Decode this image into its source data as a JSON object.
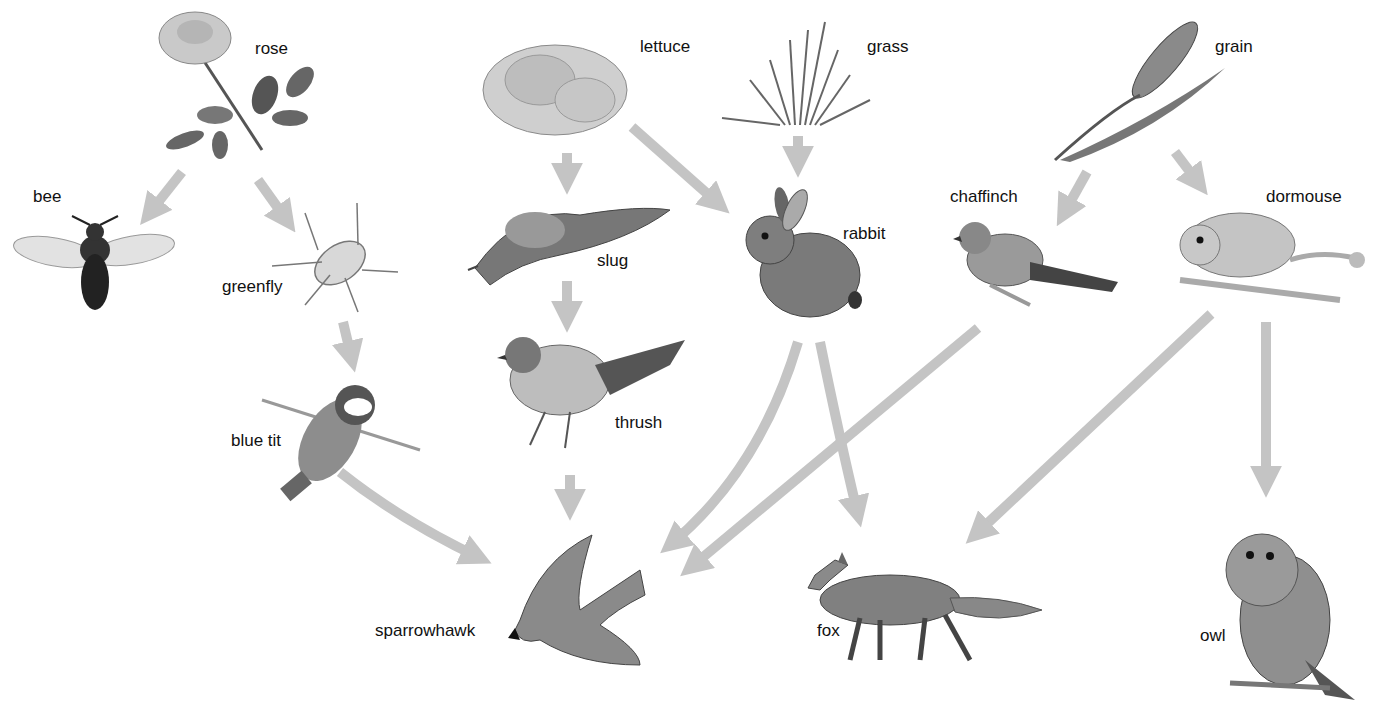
{
  "diagram": {
    "arrow_color": "#c4c4c4",
    "organisms": [
      {
        "id": "rose",
        "label": "rose",
        "x": 255,
        "y": 40
      },
      {
        "id": "lettuce",
        "label": "lettuce",
        "x": 640,
        "y": 38
      },
      {
        "id": "grass",
        "label": "grass",
        "x": 867,
        "y": 38
      },
      {
        "id": "grain",
        "label": "grain",
        "x": 1215,
        "y": 38
      },
      {
        "id": "bee",
        "label": "bee",
        "x": 33,
        "y": 188
      },
      {
        "id": "greenfly",
        "label": "greenfly",
        "x": 222,
        "y": 278
      },
      {
        "id": "slug",
        "label": "slug",
        "x": 597,
        "y": 252
      },
      {
        "id": "rabbit",
        "label": "rabbit",
        "x": 843,
        "y": 225
      },
      {
        "id": "chaffinch",
        "label": "chaffinch",
        "x": 950,
        "y": 188
      },
      {
        "id": "dormouse",
        "label": "dormouse",
        "x": 1266,
        "y": 188
      },
      {
        "id": "blue_tit",
        "label": "blue tit",
        "x": 231,
        "y": 432
      },
      {
        "id": "thrush",
        "label": "thrush",
        "x": 615,
        "y": 414
      },
      {
        "id": "sparrowhawk",
        "label": "sparrowhawk",
        "x": 375,
        "y": 622
      },
      {
        "id": "fox",
        "label": "fox",
        "x": 817,
        "y": 622
      },
      {
        "id": "owl",
        "label": "owl",
        "x": 1200,
        "y": 627
      }
    ],
    "links": [
      {
        "from": "rose",
        "to": "bee"
      },
      {
        "from": "rose",
        "to": "greenfly"
      },
      {
        "from": "greenfly",
        "to": "blue_tit"
      },
      {
        "from": "blue_tit",
        "to": "sparrowhawk"
      },
      {
        "from": "lettuce",
        "to": "slug"
      },
      {
        "from": "lettuce",
        "to": "rabbit"
      },
      {
        "from": "grass",
        "to": "rabbit"
      },
      {
        "from": "slug",
        "to": "thrush"
      },
      {
        "from": "thrush",
        "to": "sparrowhawk"
      },
      {
        "from": "rabbit",
        "to": "sparrowhawk"
      },
      {
        "from": "rabbit",
        "to": "fox"
      },
      {
        "from": "grain",
        "to": "chaffinch"
      },
      {
        "from": "grain",
        "to": "dormouse"
      },
      {
        "from": "chaffinch",
        "to": "sparrowhawk"
      },
      {
        "from": "dormouse",
        "to": "fox"
      },
      {
        "from": "dormouse",
        "to": "owl"
      }
    ]
  },
  "labels": {
    "rose": "rose",
    "lettuce": "lettuce",
    "grass": "grass",
    "grain": "grain",
    "bee": "bee",
    "greenfly": "greenfly",
    "slug": "slug",
    "rabbit": "rabbit",
    "chaffinch": "chaffinch",
    "dormouse": "dormouse",
    "blue_tit": "blue tit",
    "thrush": "thrush",
    "sparrowhawk": "sparrowhawk",
    "fox": "fox",
    "owl": "owl"
  }
}
